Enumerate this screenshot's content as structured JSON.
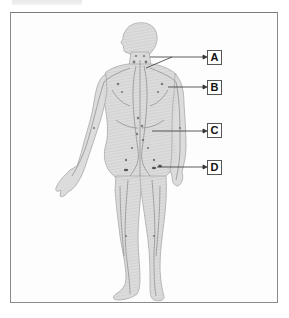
{
  "diagram": {
    "figure": "Anterior view of a human figure showing lymph vessels and lymph nodes",
    "labels": [
      {
        "id": "A",
        "text": "A",
        "box": {
          "x": 207,
          "y": 50
        },
        "line_from": {
          "x": 150,
          "y": 57
        },
        "line_to": {
          "x": 206,
          "y": 57
        },
        "secondary_from": {
          "x": 146,
          "y": 68
        },
        "secondary_to": {
          "x": 172,
          "y": 57
        }
      },
      {
        "id": "B",
        "text": "B",
        "box": {
          "x": 207,
          "y": 80
        },
        "line_from": {
          "x": 168,
          "y": 87
        },
        "line_to": {
          "x": 206,
          "y": 87
        }
      },
      {
        "id": "C",
        "text": "C",
        "box": {
          "x": 207,
          "y": 123
        },
        "line_from": {
          "x": 152,
          "y": 131
        },
        "line_to": {
          "x": 206,
          "y": 131
        }
      },
      {
        "id": "D",
        "text": "D",
        "box": {
          "x": 207,
          "y": 160
        },
        "line_from": {
          "x": 157,
          "y": 167
        },
        "line_to": {
          "x": 206,
          "y": 167
        }
      }
    ],
    "colors": {
      "frame": "#8a8a8a",
      "body_fill": "#d9d9d9",
      "body_stroke": "#a6a6a6",
      "vessels": "#8c8c8c",
      "leader_line": "#333333",
      "label_border": "#555555"
    }
  }
}
